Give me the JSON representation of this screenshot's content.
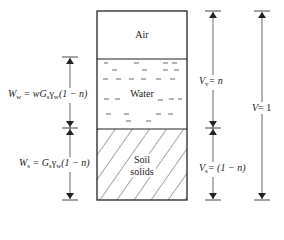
{
  "diagram": {
    "phases": [
      {
        "name": "Air",
        "label": "Air"
      },
      {
        "name": "Water",
        "label": "Water"
      },
      {
        "name": "Soil solids",
        "label_line1": "Soil",
        "label_line2": "solids"
      }
    ],
    "weights": {
      "water": {
        "symbol": "W",
        "sub": "w",
        "expr": "= wG",
        "expr_sub1": "s",
        "gamma": "γ",
        "gamma_sub": "w",
        "tail": "(1 − n)"
      },
      "solids": {
        "symbol": "W",
        "sub": "s",
        "expr": "= G",
        "expr_sub1": "s",
        "gamma": "γ",
        "gamma_sub": "w",
        "tail": "(1 − n)"
      }
    },
    "volumes": {
      "voids": {
        "symbol": "V",
        "sub": "v",
        "expr": "= n"
      },
      "solids": {
        "symbol": "V",
        "sub": "s",
        "expr": "= (1 − n)"
      },
      "total": {
        "symbol": "V",
        "expr": "= 1"
      }
    },
    "colors": {
      "line": "#222222",
      "arrow": "#555555",
      "background": "#ffffff"
    }
  }
}
